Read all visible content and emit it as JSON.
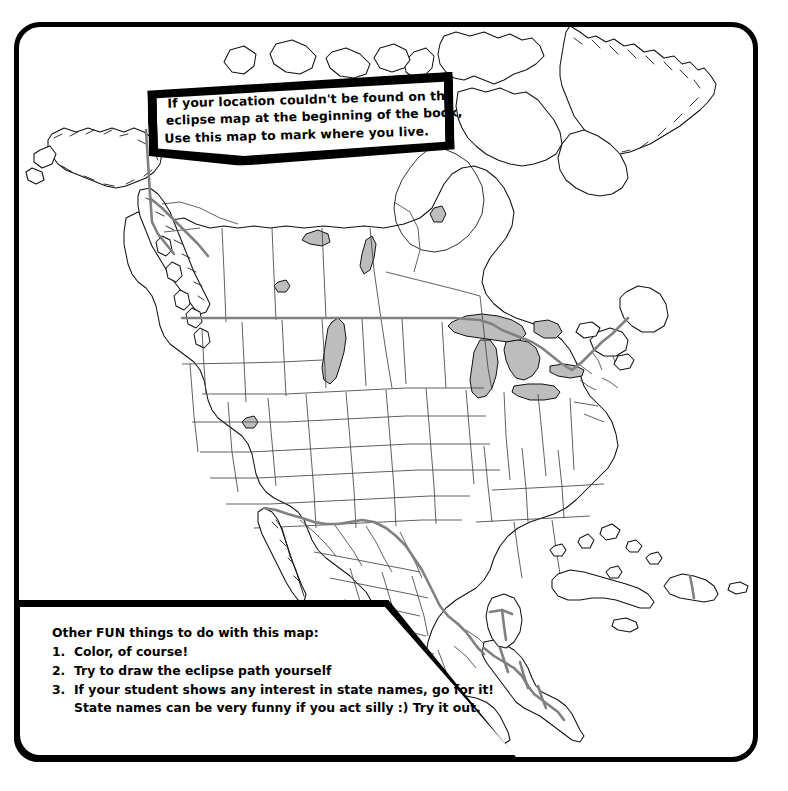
{
  "page": {
    "background_color": "#ffffff",
    "frame_color": "#000000"
  },
  "top_callout": {
    "name": "instruction-callout",
    "lines": [
      "If your location couldn't be found on the",
      "eclipse map at the beginning of the book,",
      "Use this map to mark where you live."
    ]
  },
  "bottom_callout": {
    "name": "fun-activities-callout",
    "heading": "Other FUN things to do with this map:",
    "items": [
      {
        "number": "1.",
        "text": "Color, of course!"
      },
      {
        "number": "2.",
        "text": "Try to draw the eclipse path yourself"
      },
      {
        "number": "3.",
        "text": "If your student shows any interest in state names, go for it!"
      }
    ],
    "continuation": "State names can be very funny if you act silly :)  Try it out."
  },
  "map": {
    "name": "north-america-map",
    "region": "North America",
    "features": [
      "United States with state boundaries",
      "Canada with province boundaries",
      "Mexico with state boundaries",
      "Central America",
      "Caribbean islands",
      "Greenland southern tip",
      "Alaska",
      "Great Lakes"
    ],
    "colors": {
      "coastline": "#111111",
      "state_border": "#444444",
      "international_border": "#808080",
      "lake_fill": "#bdbdbd",
      "land_fill": "#ffffff"
    }
  }
}
